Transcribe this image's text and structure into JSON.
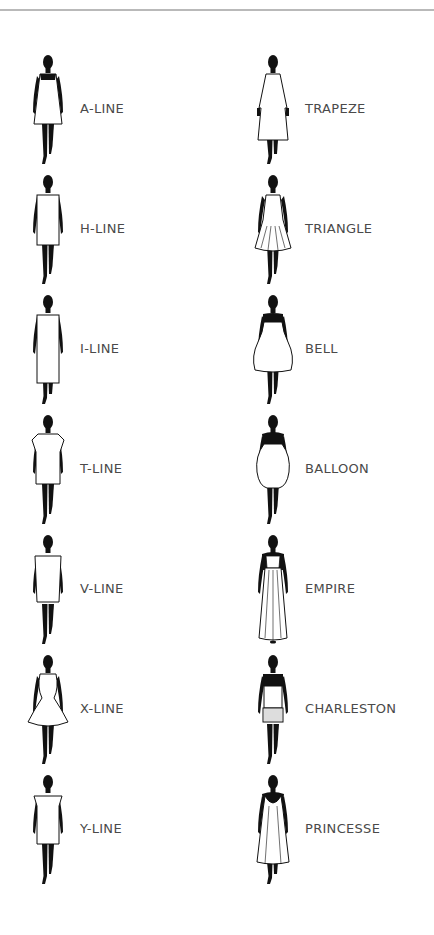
{
  "styles": {
    "left": [
      {
        "label": "A-LINE",
        "shape": "a-line"
      },
      {
        "label": "H-LINE",
        "shape": "h-line"
      },
      {
        "label": "I-LINE",
        "shape": "i-line"
      },
      {
        "label": "T-LINE",
        "shape": "t-line"
      },
      {
        "label": "V-LINE",
        "shape": "v-line"
      },
      {
        "label": "X-LINE",
        "shape": "x-line"
      },
      {
        "label": "Y-LINE",
        "shape": "y-line"
      }
    ],
    "right": [
      {
        "label": "TRAPEZE",
        "shape": "trapeze"
      },
      {
        "label": "TRIANGLE",
        "shape": "triangle"
      },
      {
        "label": "BELL",
        "shape": "bell"
      },
      {
        "label": "BALLOON",
        "shape": "balloon"
      },
      {
        "label": "EMPIRE",
        "shape": "empire"
      },
      {
        "label": "CHARLESTON",
        "shape": "charleston"
      },
      {
        "label": "PRINCESSE",
        "shape": "princesse"
      }
    ]
  },
  "colors": {
    "silhouette": "#111111",
    "label": "#4a4a4a",
    "rule": "#b9b9b9"
  }
}
